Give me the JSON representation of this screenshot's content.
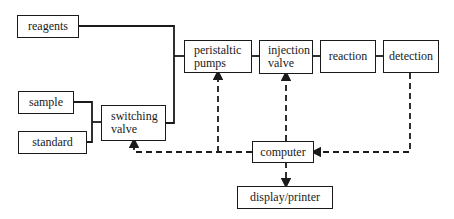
{
  "diagram": {
    "title": "",
    "nodes": {
      "reagents": {
        "label": "reagents"
      },
      "sample": {
        "label": "sample"
      },
      "standard": {
        "label": "standard"
      },
      "switching_valve": {
        "label": "switching\nvalve"
      },
      "peristaltic_pumps": {
        "label": "peristaltic\npumps"
      },
      "injection_valve": {
        "label": "injection\nvalve"
      },
      "reaction": {
        "label": "reaction"
      },
      "detection": {
        "label": "detection"
      },
      "computer": {
        "label": "computer"
      },
      "display_printer": {
        "label": "display/printer"
      }
    },
    "edges": [
      {
        "from": "reagents",
        "to": "peristaltic_pumps",
        "style": "solid"
      },
      {
        "from": "sample",
        "to": "switching_valve",
        "style": "solid"
      },
      {
        "from": "standard",
        "to": "switching_valve",
        "style": "solid"
      },
      {
        "from": "switching_valve",
        "to": "peristaltic_pumps",
        "style": "solid"
      },
      {
        "from": "peristaltic_pumps",
        "to": "injection_valve",
        "style": "solid"
      },
      {
        "from": "injection_valve",
        "to": "reaction",
        "style": "solid"
      },
      {
        "from": "reaction",
        "to": "detection",
        "style": "solid"
      },
      {
        "from": "detection",
        "to": "computer",
        "style": "dashed",
        "arrow": "computer"
      },
      {
        "from": "computer",
        "to": "switching_valve",
        "style": "dashed",
        "arrow": "switching_valve"
      },
      {
        "from": "computer",
        "to": "peristaltic_pumps",
        "style": "dashed",
        "arrow": "peristaltic_pumps"
      },
      {
        "from": "computer",
        "to": "injection_valve",
        "style": "dashed",
        "arrow": "injection_valve"
      },
      {
        "from": "computer",
        "to": "display_printer",
        "style": "dashed",
        "arrow": "display_printer"
      }
    ],
    "colors": {
      "line": "#1a1a1a",
      "background": "#ffffff"
    }
  }
}
